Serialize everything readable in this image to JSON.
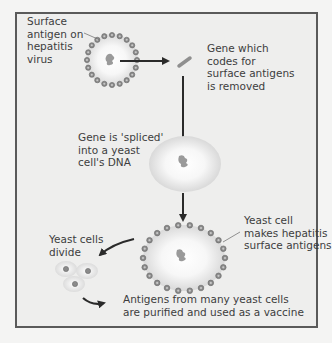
{
  "diagram": {
    "colors": {
      "background": "#eeeeed",
      "frame_border": "#5a5a5a",
      "antigen_dot": "#8a8a8a",
      "arrow": "#2a2a2a",
      "gene": "#9a9a9a",
      "cell_fill": "#ffffff"
    },
    "labels": {
      "virus_antigen": "Surface\nantigen on\nhepatitis\nvirus",
      "gene_removed": "Gene which\ncodes for\nsurface antigens\nis removed",
      "gene_spliced": "Gene is 'spliced'\ninto a yeast\ncell's DNA",
      "yeast_makes": "Yeast cell\nmakes hepatitis\nsurface antigens",
      "yeast_divide": "Yeast cells\ndivide",
      "purified": "Antigens from many yeast cells\nare purified and used as a vaccine"
    },
    "nodes": [
      {
        "id": "hepatitis-virus",
        "label": "Surface antigen on hepatitis virus"
      },
      {
        "id": "gene-fragment",
        "label": "Gene which codes for surface antigens is removed"
      },
      {
        "id": "yeast-cell-spliced",
        "label": "Gene is 'spliced' into a yeast cell's DNA"
      },
      {
        "id": "yeast-cell-antigens",
        "label": "Yeast cell makes hepatitis surface antigens"
      },
      {
        "id": "dividing-yeast-cells",
        "label": "Yeast cells divide"
      },
      {
        "id": "vaccine",
        "label": "Antigens from many yeast cells are purified and used as a vaccine"
      }
    ],
    "edges": [
      {
        "from": "hepatitis-virus",
        "to": "gene-fragment"
      },
      {
        "from": "gene-fragment",
        "to": "yeast-cell-spliced"
      },
      {
        "from": "yeast-cell-spliced",
        "to": "yeast-cell-antigens"
      },
      {
        "from": "yeast-cell-antigens",
        "to": "dividing-yeast-cells"
      },
      {
        "from": "dividing-yeast-cells",
        "to": "vaccine"
      }
    ]
  }
}
